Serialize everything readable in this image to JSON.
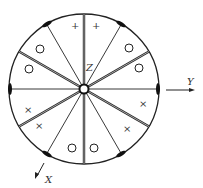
{
  "diagram": {
    "axes": {
      "z_label": "Z",
      "y_label": "Y",
      "x_label": "X"
    },
    "colors": {
      "line": "#222222",
      "background": "#ffffff"
    },
    "sector_marks": {
      "top": [
        "+",
        "+"
      ],
      "upper_right": [
        "O",
        "O"
      ],
      "lower_right": [
        "×",
        "×"
      ],
      "bottom": [
        "O",
        "O"
      ],
      "lower_left": [
        "×",
        "×"
      ],
      "upper_left": [
        "O",
        "O"
      ]
    }
  }
}
